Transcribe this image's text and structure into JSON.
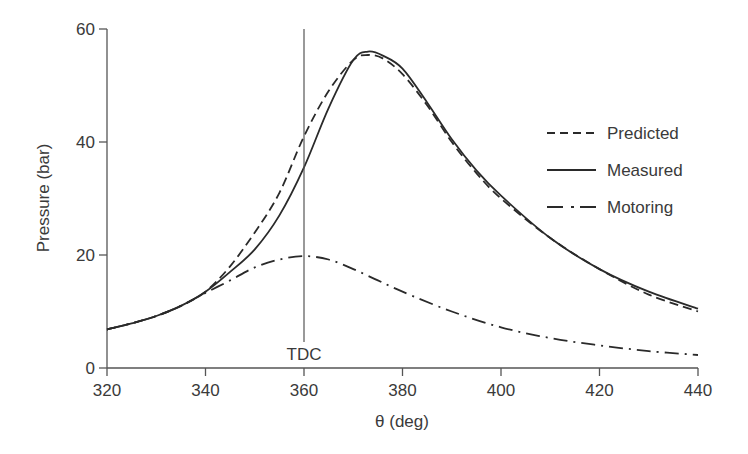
{
  "chart_data": {
    "type": "line",
    "title": "",
    "xlabel": "θ (deg)",
    "ylabel": "Pressure (bar)",
    "xlim": [
      320,
      440
    ],
    "ylim": [
      0,
      60
    ],
    "xticks": [
      320,
      340,
      360,
      380,
      400,
      420,
      440
    ],
    "yticks": [
      0,
      20,
      40,
      60
    ],
    "grid": false,
    "legend_position": "right-middle",
    "annotations": [
      {
        "type": "vline",
        "x": 360,
        "label": "TDC"
      }
    ],
    "series": [
      {
        "name": "Predicted",
        "style": "dashed",
        "x": [
          320,
          325,
          330,
          335,
          340,
          345,
          350,
          355,
          360,
          365,
          370,
          373,
          376,
          380,
          385,
          390,
          395,
          400,
          410,
          420,
          430,
          440
        ],
        "y": [
          6.8,
          7.9,
          9.2,
          11.0,
          13.5,
          18.0,
          24.0,
          31.0,
          41.0,
          49.0,
          54.5,
          55.4,
          54.8,
          52.0,
          46.5,
          40.0,
          34.5,
          30.0,
          23.0,
          17.5,
          13.0,
          10.0
        ]
      },
      {
        "name": "Measured",
        "style": "solid",
        "x": [
          320,
          325,
          330,
          335,
          340,
          345,
          350,
          355,
          360,
          365,
          370,
          373,
          376,
          380,
          385,
          390,
          395,
          400,
          410,
          420,
          430,
          440
        ],
        "y": [
          6.8,
          7.9,
          9.2,
          11.0,
          13.5,
          17.0,
          21.0,
          27.0,
          35.5,
          46.0,
          54.5,
          56.0,
          55.3,
          53.0,
          47.0,
          40.5,
          35.0,
          30.5,
          23.0,
          17.5,
          13.5,
          10.5
        ]
      },
      {
        "name": "Motoring",
        "style": "dash-dot",
        "x": [
          320,
          325,
          330,
          335,
          340,
          345,
          350,
          355,
          360,
          365,
          370,
          375,
          380,
          390,
          400,
          410,
          420,
          430,
          440
        ],
        "y": [
          6.8,
          7.9,
          9.2,
          11.0,
          13.3,
          15.5,
          17.8,
          19.2,
          19.8,
          19.2,
          17.5,
          15.5,
          13.5,
          10.0,
          7.2,
          5.3,
          4.0,
          3.0,
          2.3
        ]
      }
    ]
  },
  "legend": {
    "items": [
      {
        "label": "Predicted",
        "style": "dashed"
      },
      {
        "label": "Measured",
        "style": "solid"
      },
      {
        "label": "Motoring",
        "style": "dash-dot"
      }
    ]
  },
  "colors": {
    "line": "#2a2a2a",
    "axis": "#555555",
    "text": "#3a3a3a"
  }
}
